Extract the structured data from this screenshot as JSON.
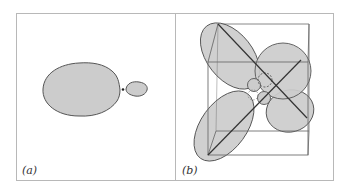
{
  "figure": {
    "panels": [
      {
        "id": "a",
        "label": "(a)",
        "description": "Single lobed orbital: large lobe with small opposite lobe and nucleus dot"
      },
      {
        "id": "b",
        "label": "(b)",
        "description": "Hybrid orbitals directed along body diagonals of a cube (tetrahedral arrangement)"
      }
    ],
    "colors": {
      "frame": "#b8b8b8",
      "lobe_fill": "#cccccc",
      "lobe_stroke": "#555555",
      "cube_edge": "#6f6f6f",
      "diagonal": "#333333",
      "background": "#ffffff"
    }
  }
}
